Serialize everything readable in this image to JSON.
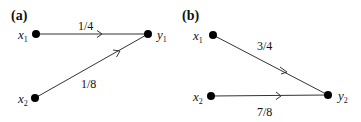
{
  "panels": [
    {
      "id": "a",
      "label": "(a)",
      "nodes": [
        {
          "name": "x",
          "sub": "1",
          "x": 36,
          "y": 34
        },
        {
          "name": "x",
          "sub": "2",
          "x": 35,
          "y": 98
        },
        {
          "name": "y",
          "sub": "1",
          "x": 148,
          "y": 34
        }
      ],
      "edges": [
        {
          "from": "x1",
          "to": "y1",
          "label": "1/4"
        },
        {
          "from": "x2",
          "to": "y1",
          "label": "1/8"
        }
      ]
    },
    {
      "id": "b",
      "label": "(b)",
      "nodes": [
        {
          "name": "x",
          "sub": "1",
          "x": 213,
          "y": 35
        },
        {
          "name": "x",
          "sub": "2",
          "x": 211,
          "y": 96
        },
        {
          "name": "y",
          "sub": "2",
          "x": 328,
          "y": 95
        }
      ],
      "edges": [
        {
          "from": "x1",
          "to": "y2",
          "label": "3/4"
        },
        {
          "from": "x2",
          "to": "y2",
          "label": "7/8"
        }
      ]
    }
  ]
}
